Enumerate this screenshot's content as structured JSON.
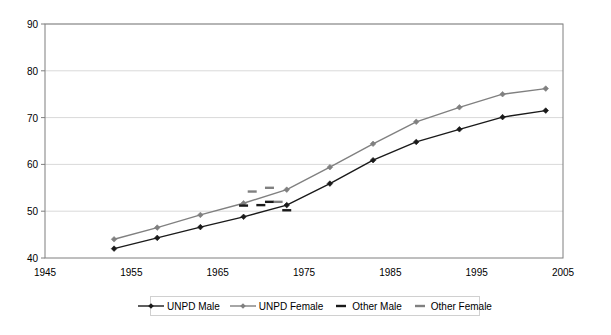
{
  "chart_data": {
    "type": "line",
    "title": "",
    "xlabel": "",
    "ylabel": "",
    "xlim": [
      1945,
      2005
    ],
    "ylim": [
      40,
      90
    ],
    "xticks": [
      1945,
      1955,
      1965,
      1975,
      1985,
      1995,
      2005
    ],
    "yticks": [
      40,
      50,
      60,
      70,
      80,
      90
    ],
    "grid": "horizontal",
    "legend_position": "bottom",
    "series": [
      {
        "name": "UNPD Male",
        "color": "#1a1a1a",
        "marker": "diamond",
        "linestyle": "solid",
        "x": [
          1953,
          1958,
          1963,
          1968,
          1973,
          1978,
          1983,
          1988,
          1993,
          1998,
          2003
        ],
        "y": [
          42.0,
          44.3,
          46.6,
          48.8,
          51.3,
          55.9,
          60.9,
          64.8,
          67.5,
          70.1,
          71.5
        ]
      },
      {
        "name": "UNPD Female",
        "color": "#808080",
        "marker": "diamond",
        "linestyle": "solid",
        "x": [
          1953,
          1958,
          1963,
          1968,
          1973,
          1978,
          1983,
          1988,
          1993,
          1998,
          2003
        ],
        "y": [
          44.0,
          46.5,
          49.2,
          51.7,
          54.6,
          59.4,
          64.4,
          69.1,
          72.2,
          75.0,
          76.2
        ]
      },
      {
        "name": "Other Male",
        "color": "#1a1a1a",
        "marker": "dash",
        "linestyle": "none",
        "x": [
          1968,
          1970,
          1971,
          1973
        ],
        "y": [
          51.2,
          51.3,
          52.0,
          50.2
        ]
      },
      {
        "name": "Other Female",
        "color": "#808080",
        "marker": "dash",
        "linestyle": "none",
        "x": [
          1969,
          1971,
          1972
        ],
        "y": [
          54.2,
          55.0,
          52.0
        ]
      }
    ]
  },
  "axis": {
    "y_labels": [
      "90",
      "80",
      "70",
      "60",
      "50",
      "40"
    ],
    "x_labels": [
      "1945",
      "1955",
      "1965",
      "1975",
      "1985",
      "1995",
      "2005"
    ]
  },
  "legend": {
    "items": [
      {
        "label": "UNPD Male",
        "color": "#1a1a1a",
        "style": "line-marker"
      },
      {
        "label": "UNPD Female",
        "color": "#808080",
        "style": "line-marker"
      },
      {
        "label": "Other Male",
        "color": "#1a1a1a",
        "style": "dash"
      },
      {
        "label": "Other Female",
        "color": "#808080",
        "style": "dash"
      }
    ]
  },
  "colors": {
    "male": "#1a1a1a",
    "female": "#808080",
    "grid": "#d9d9d9",
    "frame": "#7f7f7f",
    "background": "#ffffff"
  }
}
